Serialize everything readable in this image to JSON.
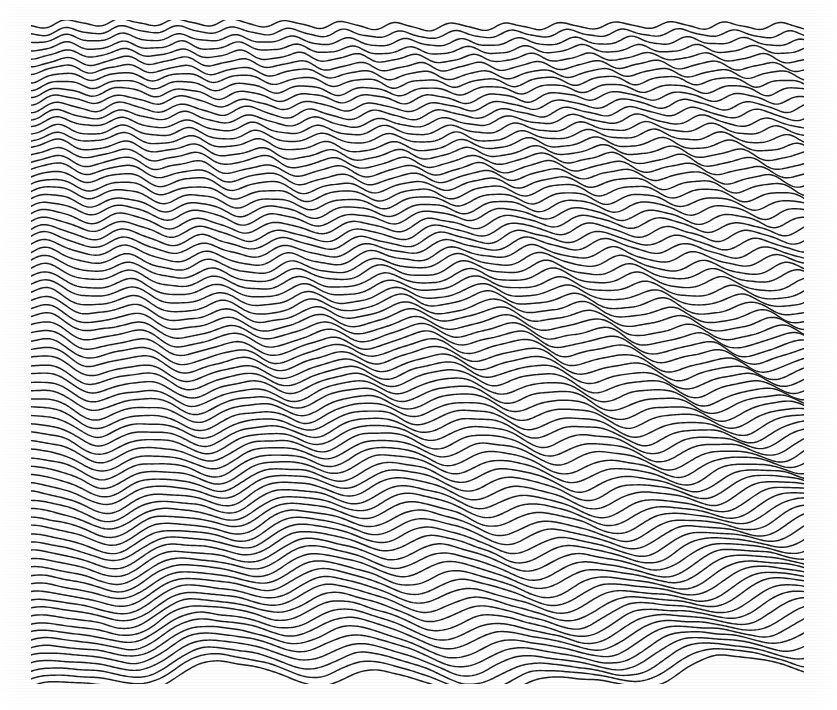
{
  "figure": {
    "title": "",
    "caption": "",
    "background_color": "#ffffff",
    "trace_color": "#1c1c1c",
    "alt_text": "Stacked waterfall ridge plot of oscillating traces"
  },
  "chart_data": {
    "type": "line",
    "title": "",
    "subtitle": "",
    "xlabel": "",
    "ylabel": "",
    "series_label": "trace",
    "legend": [],
    "legend_position": "none",
    "grid": false,
    "axes_visible": false,
    "tick_labels_x": [],
    "tick_labels_y": [],
    "style": "waterfall-ridge-stack",
    "plot_area_px": {
      "x": 31,
      "y": 26,
      "width": 773,
      "height": 654
    },
    "xlim": [
      0,
      1
    ],
    "ylim": [
      0,
      1
    ],
    "n_series": 84,
    "row_spacing_px": 7.85,
    "line_width_px": 1.45,
    "render_order": "top-to-bottom-overlap",
    "generator": {
      "description": "Each trace i (0 = top row, 83 = bottom row) is a sum of a carrier oscillation whose wavelength grows downward and a slow envelope modulation, drawn as a clipped ridge line.",
      "carrier": {
        "wavelength_px_top": 55,
        "wavelength_px_bottom": 168,
        "wavelength_interp": "exponential",
        "amplitude_px_top": 3.4,
        "amplitude_px_bottom": 10.5,
        "amplitude_interp": "linear",
        "phase_drift_px_per_row": 1.85,
        "phase_offset_px": 0
      },
      "envelope": {
        "wavelength_px": 560,
        "amplitude_px_top": 2.2,
        "amplitude_px_bottom": 13.5,
        "phase_drift_px_per_row": 5.6
      },
      "secondary": {
        "wavelength_ratio": 0.5,
        "amplitude_fraction": 0.22,
        "phase_drift_px_per_row": -1.1
      },
      "tertiary": {
        "wavelength_px": 1120,
        "amplitude_px": 6.0,
        "phase_drift_px_per_row": 9.0
      },
      "jitter_amplitude_px": 0.55,
      "samples_per_trace": 420,
      "random_seed": 20240517
    }
  }
}
